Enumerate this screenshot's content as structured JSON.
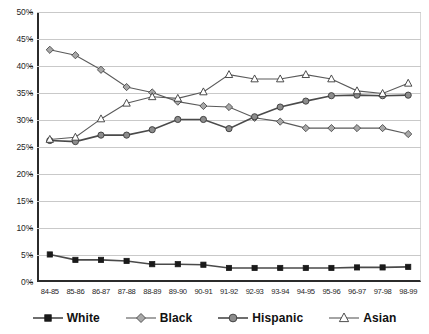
{
  "chart_data": {
    "type": "line",
    "title": "",
    "subtitle": "",
    "xlabel": "",
    "ylabel": "",
    "ylim": [
      0,
      50
    ],
    "ytick_labels": [
      "0%",
      "5%",
      "10%",
      "15%",
      "20%",
      "25%",
      "30%",
      "35%",
      "40%",
      "45%",
      "50%"
    ],
    "ytick_values": [
      0,
      5,
      10,
      15,
      20,
      25,
      30,
      35,
      40,
      45,
      50
    ],
    "grid": true,
    "legend_position": "bottom",
    "categories": [
      "84-85",
      "85-86",
      "86-87",
      "87-88",
      "88-89",
      "89-90",
      "90-91",
      "91-92",
      "92-93",
      "93-94",
      "94-95",
      "95-96",
      "96-97",
      "97-98",
      "98-99"
    ],
    "series": [
      {
        "name": "White",
        "marker": "filled-square",
        "color": "#1a1a1a",
        "values": [
          5.1,
          4.1,
          4.1,
          3.9,
          3.3,
          3.3,
          3.2,
          2.6,
          2.6,
          2.6,
          2.6,
          2.6,
          2.7,
          2.7,
          2.8
        ]
      },
      {
        "name": "Black",
        "marker": "gray-diamond",
        "color": "#a8a8a8",
        "values": [
          43.0,
          42.0,
          39.3,
          36.1,
          35.1,
          33.4,
          32.6,
          32.4,
          30.4,
          29.7,
          28.5,
          28.5,
          28.5,
          28.5,
          27.4
        ]
      },
      {
        "name": "Hispanic",
        "marker": "gray-circle",
        "color": "#8c8c8c",
        "values": [
          26.2,
          26.0,
          27.2,
          27.2,
          28.2,
          30.1,
          30.1,
          28.4,
          30.6,
          32.4,
          33.5,
          34.5,
          34.6,
          34.5,
          34.6
        ]
      },
      {
        "name": "Asian",
        "marker": "open-triangle",
        "color": "#ffffff",
        "values": [
          26.4,
          26.8,
          30.2,
          33.1,
          34.3,
          34.0,
          35.2,
          38.4,
          37.6,
          37.6,
          38.4,
          37.6,
          35.4,
          34.9,
          36.8
        ]
      }
    ]
  },
  "legend": {
    "items": [
      {
        "label": "White",
        "marker": "filled-square-marker"
      },
      {
        "label": "Black",
        "marker": "gray-diamond-marker"
      },
      {
        "label": "Hispanic",
        "marker": "gray-circle-marker"
      },
      {
        "label": "Asian",
        "marker": "open-triangle-marker"
      }
    ]
  }
}
